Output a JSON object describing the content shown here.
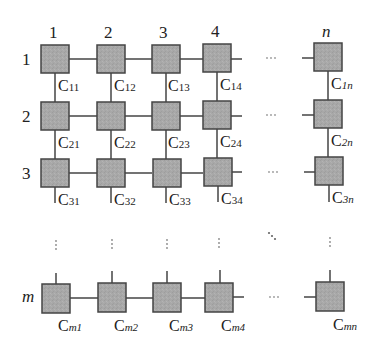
{
  "diagram": {
    "type": "2D grid array of cells",
    "column_headers": [
      "1",
      "2",
      "3",
      "4",
      "n"
    ],
    "row_headers": [
      "1",
      "2",
      "3",
      "m"
    ],
    "cells": [
      {
        "row": "1",
        "labels": [
          "11",
          "12",
          "13",
          "14",
          "1n"
        ]
      },
      {
        "row": "2",
        "labels": [
          "21",
          "22",
          "23",
          "24",
          "2n"
        ]
      },
      {
        "row": "3",
        "labels": [
          "31",
          "32",
          "33",
          "34",
          "3n"
        ]
      },
      {
        "row": "m",
        "labels": [
          "m1",
          "m2",
          "m3",
          "m4",
          "mn"
        ]
      }
    ],
    "cell_prefix": "C",
    "ellipsis_horizontal": "···",
    "ellipsis_vertical": "⋮",
    "ellipsis_diagonal": "⋱",
    "box_fill": "#a9a9a9",
    "box_stroke": "#444444",
    "line_color": "#444444"
  },
  "labels": {
    "col_1": "1",
    "col_2": "2",
    "col_3": "3",
    "col_4": "4",
    "col_n": "n",
    "row_1": "1",
    "row_2": "2",
    "row_3": "3",
    "row_m": "m",
    "c": "C",
    "s11": "11",
    "s12": "12",
    "s13": "13",
    "s14": "14",
    "s1n": "1n",
    "s21": "21",
    "s22": "22",
    "s23": "23",
    "s24": "24",
    "s2n": "2n",
    "s31": "31",
    "s32": "32",
    "s33": "33",
    "s34": "34",
    "s3n": "3n",
    "sm1": "m1",
    "sm2": "m2",
    "sm3": "m3",
    "sm4": "m4",
    "smn": "mn"
  }
}
